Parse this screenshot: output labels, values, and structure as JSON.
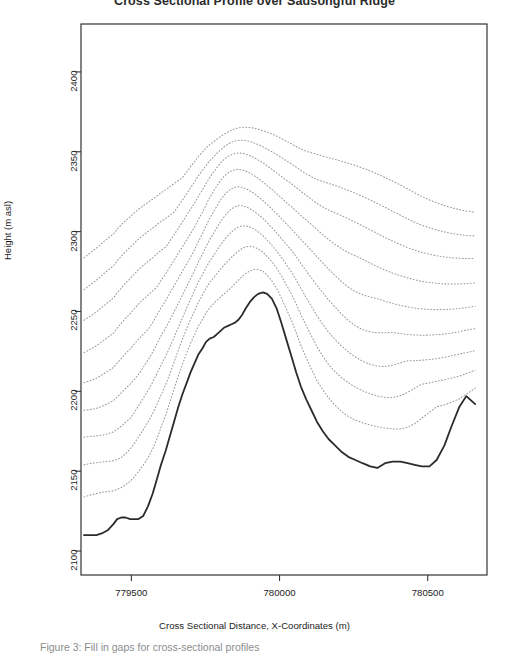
{
  "figure": {
    "title": "Cross Sectional Profile over Sadsongful Ridge",
    "caption": "Figure 3: Fill in gaps for cross-sectional profiles"
  },
  "chart_data": {
    "type": "line",
    "title": "Cross Sectional Profile over Sadsongful Ridge",
    "xlabel": "Cross Sectional Distance, X-Coordinates (m)",
    "ylabel": "Height (m asl)",
    "xlim": [
      779330,
      780700
    ],
    "ylim": [
      2085,
      2430
    ],
    "grid": false,
    "legend": "none",
    "xticks": [
      779500,
      780000,
      780500
    ],
    "xtick_labels": [
      "779500",
      "780000",
      "780500"
    ],
    "yticks": [
      2100,
      2150,
      2200,
      2250,
      2300,
      2350,
      2400
    ],
    "ytick_labels": [
      "2100",
      "2150",
      "2200",
      "2250",
      "2300",
      "2350",
      "2400"
    ],
    "series": [
      {
        "name": "Observed terrain profile",
        "style": "solid",
        "color": "#2b2b2b",
        "width": 1.8,
        "x": [
          779340,
          779360,
          779382,
          779400,
          779420,
          779440,
          779452,
          779466,
          779480,
          779496,
          779510,
          779524,
          779540,
          779556,
          779572,
          779586,
          779600,
          779616,
          779630,
          779644,
          779658,
          779672,
          779686,
          779700,
          779714,
          779726,
          779740,
          779752,
          779764,
          779778,
          779790,
          779802,
          779814,
          779826,
          779838,
          779850,
          779862,
          779874,
          779886,
          779900,
          779914,
          779928,
          779944,
          779958,
          779974,
          779990,
          780006,
          780022,
          780040,
          780056,
          780072,
          780090,
          780108,
          780126,
          780146,
          780166,
          780188,
          780210,
          780232,
          780256,
          780280,
          780306,
          780330,
          780356,
          780382,
          780408,
          780432,
          780456,
          780480,
          780506,
          780530,
          780556,
          780580,
          780606,
          780630,
          780660
        ],
        "y": [
          2110,
          2110,
          2110,
          2111,
          2113,
          2117,
          2120,
          2121,
          2121,
          2120,
          2120,
          2120,
          2122,
          2128,
          2136,
          2145,
          2154,
          2163,
          2172,
          2181,
          2190,
          2198,
          2205,
          2212,
          2218,
          2223,
          2227,
          2231,
          2233,
          2234,
          2236,
          2238,
          2240,
          2241,
          2242,
          2243,
          2245,
          2248,
          2252,
          2256,
          2259,
          2261,
          2262,
          2261,
          2258,
          2252,
          2243,
          2233,
          2222,
          2212,
          2203,
          2195,
          2188,
          2181,
          2175,
          2170,
          2166,
          2162,
          2159,
          2157,
          2155,
          2153,
          2152,
          2155,
          2156,
          2156,
          2155,
          2154,
          2153,
          2153,
          2157,
          2166,
          2178,
          2190,
          2197,
          2192
        ]
      },
      {
        "name": "Interpolated profile 1",
        "style": "dotted",
        "color": "#9a9a9a",
        "offset": 22
      },
      {
        "name": "Interpolated profile 2",
        "style": "dotted",
        "color": "#9a9a9a",
        "offset": 40
      },
      {
        "name": "Interpolated profile 3",
        "style": "dotted",
        "color": "#9a9a9a",
        "offset": 56
      },
      {
        "name": "Interpolated profile 4",
        "style": "dotted",
        "color": "#9a9a9a",
        "offset": 72
      },
      {
        "name": "Interpolated profile 5",
        "style": "dotted",
        "color": "#9a9a9a",
        "offset": 88
      },
      {
        "name": "Interpolated profile 6",
        "style": "dotted",
        "color": "#9a9a9a",
        "offset": 104
      },
      {
        "name": "Interpolated profile 7",
        "style": "dotted",
        "color": "#9a9a9a",
        "offset": 120
      },
      {
        "name": "Interpolated profile 8",
        "style": "dotted",
        "color": "#9a9a9a",
        "offset": 134
      },
      {
        "name": "Interpolated profile 9",
        "style": "dotted",
        "color": "#9a9a9a",
        "offset": 148
      }
    ]
  }
}
